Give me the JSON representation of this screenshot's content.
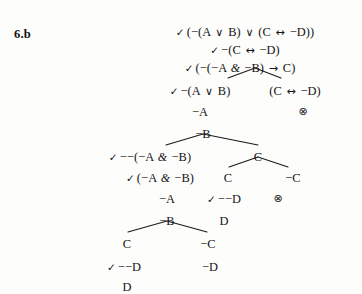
{
  "diagram": {
    "type": "truth-tree",
    "exercise_label": "6.b",
    "background_color": "#fdfdfb",
    "ink_color": "#141414",
    "closed_branch_symbol": "⊗",
    "check_symbol": "✓",
    "nodes": [
      {
        "id": "n1",
        "text": "✓ (−(A ∨ B) ∨ (C ↔ −D))",
        "x": 245,
        "y": 26,
        "checked": true
      },
      {
        "id": "n2",
        "text": "✓ −(C ↔ −D)",
        "x": 245,
        "y": 44,
        "checked": true
      },
      {
        "id": "n3",
        "text": "✓ (−(−A & −B) → C)",
        "x": 240,
        "y": 62,
        "checked": true
      },
      {
        "id": "n4",
        "text": "✓ −(A ∨ B)",
        "x": 200,
        "y": 85,
        "checked": true
      },
      {
        "id": "n5",
        "text": "(C ↔ −D)",
        "x": 295,
        "y": 85,
        "checked": false
      },
      {
        "id": "n6",
        "text": "−A",
        "x": 200,
        "y": 106,
        "checked": false
      },
      {
        "id": "n7",
        "text": "−B",
        "x": 203,
        "y": 128,
        "checked": false
      },
      {
        "id": "n8",
        "text": "✓ −−(−A & −B)",
        "x": 150,
        "y": 151,
        "checked": true
      },
      {
        "id": "n9",
        "text": "C",
        "x": 258,
        "y": 151,
        "checked": false
      },
      {
        "id": "n10",
        "text": "✓ (−A & −B)",
        "x": 160,
        "y": 172,
        "checked": true
      },
      {
        "id": "n11",
        "text": "C",
        "x": 228,
        "y": 172,
        "checked": false
      },
      {
        "id": "n12",
        "text": "−C",
        "x": 293,
        "y": 172,
        "checked": false
      },
      {
        "id": "n13",
        "text": "−A",
        "x": 167,
        "y": 193,
        "checked": false
      },
      {
        "id": "n14",
        "text": "✓ −−D",
        "x": 224,
        "y": 193,
        "checked": true
      },
      {
        "id": "n15",
        "text": "−B",
        "x": 167,
        "y": 215,
        "checked": false
      },
      {
        "id": "n16",
        "text": "D",
        "x": 224,
        "y": 215,
        "checked": false
      },
      {
        "id": "n17",
        "text": "C",
        "x": 127,
        "y": 238,
        "checked": false
      },
      {
        "id": "n18",
        "text": "−C",
        "x": 208,
        "y": 238,
        "checked": false
      },
      {
        "id": "n19",
        "text": "✓ −−D",
        "x": 124,
        "y": 261,
        "checked": true
      },
      {
        "id": "n20",
        "text": "−D",
        "x": 210,
        "y": 261,
        "checked": false
      },
      {
        "id": "n21",
        "text": "D",
        "x": 127,
        "y": 281,
        "checked": false
      }
    ],
    "closures": [
      {
        "id": "x1",
        "x": 303,
        "y": 106
      },
      {
        "id": "x2",
        "x": 278,
        "y": 193
      }
    ],
    "forks": [
      {
        "id": "f1",
        "apex_x": 255,
        "apex_y": 68,
        "left_x": 228,
        "right_x": 281,
        "bottom_y": 78
      },
      {
        "id": "f2",
        "apex_x": 203,
        "apex_y": 134,
        "left_x": 166,
        "right_x": 258,
        "bottom_y": 145
      },
      {
        "id": "f3",
        "apex_x": 258,
        "apex_y": 157,
        "left_x": 229,
        "right_x": 288,
        "bottom_y": 167
      },
      {
        "id": "f4",
        "apex_x": 167,
        "apex_y": 221,
        "left_x": 128,
        "right_x": 207,
        "bottom_y": 232
      }
    ]
  }
}
